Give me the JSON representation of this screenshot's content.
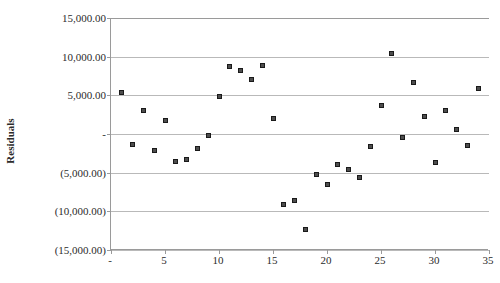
{
  "chart": {
    "title": "",
    "top_cut_text": "",
    "axis_title_y": "Residuals",
    "axis_title_x": "",
    "y_tick_labels": [
      "15,000.00",
      "10,000.00",
      "5,000.00",
      "-",
      "(5,000.00)",
      "(10,000.00)",
      "(15,000.00)"
    ],
    "x_tick_labels": [
      "-",
      "5",
      "10",
      "15",
      "20",
      "25",
      "30",
      "35"
    ],
    "marker_color": "#4d4d4d",
    "gridline_color": "#b9b9b9",
    "axis_color": "#9a9a9a"
  },
  "chart_data": {
    "type": "scatter",
    "title": "",
    "xlabel": "",
    "ylabel": "Residuals",
    "xlim": [
      0,
      35
    ],
    "ylim": [
      -15000,
      15000
    ],
    "xticks": [
      0,
      5,
      10,
      15,
      20,
      25,
      30,
      35
    ],
    "yticks": [
      -15000,
      -10000,
      -5000,
      0,
      5000,
      10000,
      15000
    ],
    "ytick_format": "accounting-parentheses-negatives, zero shown as dash",
    "grid": "horizontal",
    "legend": "none",
    "series": [
      {
        "name": "Residuals",
        "points": [
          {
            "x": 1,
            "y": 5400
          },
          {
            "x": 2,
            "y": -1400
          },
          {
            "x": 3,
            "y": 3100
          },
          {
            "x": 4,
            "y": -2100
          },
          {
            "x": 5,
            "y": 1800
          },
          {
            "x": 6,
            "y": -3600
          },
          {
            "x": 7,
            "y": -3300
          },
          {
            "x": 8,
            "y": -1900
          },
          {
            "x": 9,
            "y": -150
          },
          {
            "x": 11,
            "y": 8700
          },
          {
            "x": 12,
            "y": 8200
          },
          {
            "x": 13,
            "y": 7100
          },
          {
            "x": 14,
            "y": 8900
          },
          {
            "x": 10,
            "y": 4900
          },
          {
            "x": 15,
            "y": 2000
          },
          {
            "x": 16,
            "y": -9100
          },
          {
            "x": 17,
            "y": -8600
          },
          {
            "x": 18,
            "y": -12300
          },
          {
            "x": 19,
            "y": -5200
          },
          {
            "x": 20,
            "y": -6500
          },
          {
            "x": 21,
            "y": -3900
          },
          {
            "x": 22,
            "y": -4600
          },
          {
            "x": 23,
            "y": -5600
          },
          {
            "x": 24,
            "y": -1600
          },
          {
            "x": 26,
            "y": 10400
          },
          {
            "x": 25,
            "y": 3700
          },
          {
            "x": 27,
            "y": -400
          },
          {
            "x": 28,
            "y": 6700
          },
          {
            "x": 29,
            "y": 2200
          },
          {
            "x": 30,
            "y": -3700
          },
          {
            "x": 31,
            "y": 3000
          },
          {
            "x": 32,
            "y": 600
          },
          {
            "x": 33,
            "y": -1500
          },
          {
            "x": 34,
            "y": 5900
          }
        ]
      }
    ]
  }
}
